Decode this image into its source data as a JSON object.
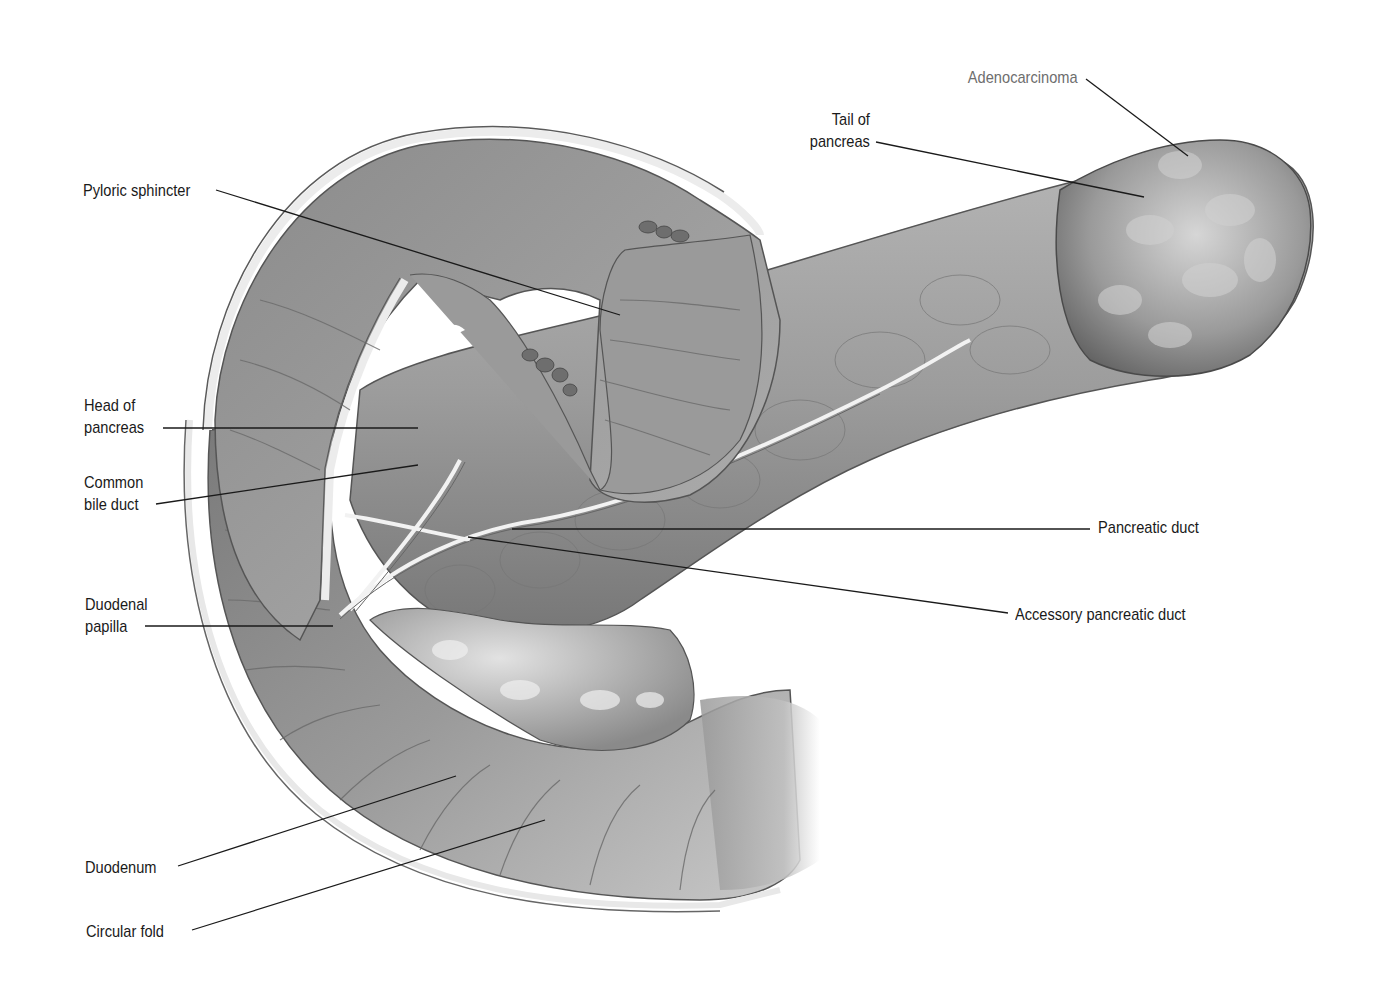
{
  "figure": {
    "colors": {
      "background": "#ffffff",
      "label_text": "#1a1a1a",
      "label_text_highlight": "#6e6e6e",
      "leader_line": "#1a1a1a",
      "tissue_dark": "#5a5a5a",
      "tissue_mid": "#8c8c8c",
      "tissue_light": "#c8c8c8",
      "tissue_highlight": "#ececec"
    }
  },
  "labels": {
    "adenocarcinoma": {
      "lines": [
        "Adenocarcinoma"
      ]
    },
    "tail_of_pancreas": {
      "lines": [
        "Tail of",
        "pancreas"
      ]
    },
    "pyloric_sphincter": {
      "lines": [
        "Pyloric sphincter"
      ]
    },
    "head_of_pancreas": {
      "lines": [
        "Head of",
        "pancreas"
      ]
    },
    "common_bile_duct": {
      "lines": [
        "Common",
        "bile duct"
      ]
    },
    "pancreatic_duct": {
      "lines": [
        "Pancreatic duct"
      ]
    },
    "accessory_pancreatic_duct": {
      "lines": [
        "Accessory pancreatic duct"
      ]
    },
    "duodenal_papilla": {
      "lines": [
        "Duodenal",
        "papilla"
      ]
    },
    "duodenum": {
      "lines": [
        "Duodenum"
      ]
    },
    "circular_fold": {
      "lines": [
        "Circular fold"
      ]
    }
  }
}
